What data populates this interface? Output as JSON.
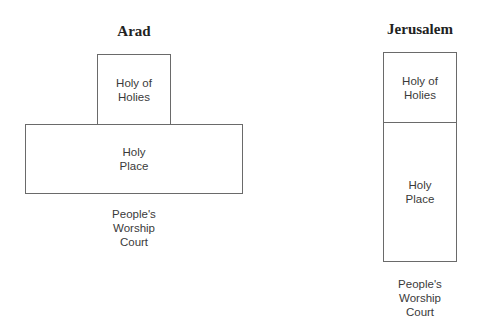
{
  "diagrams": [
    {
      "title": "Arad",
      "holy_of_holies": "Holy of\nHolies",
      "holy_place": "Holy\nPlace",
      "court": "People's\nWorship\nCourt"
    },
    {
      "title": "Jerusalem",
      "holy_of_holies": "Holy of\nHolies",
      "holy_place": "Holy\nPlace",
      "court": "People's\nWorship\nCourt"
    }
  ]
}
